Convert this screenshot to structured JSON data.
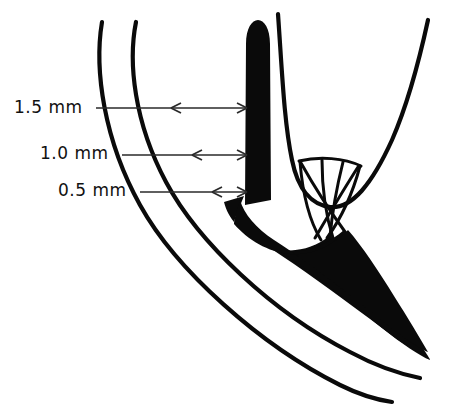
{
  "figure": {
    "width": 449,
    "height": 410,
    "background_color": "#ffffff",
    "ink_color": "#000000"
  },
  "measurements": [
    {
      "id": "m15",
      "label": "1.5 mm",
      "value": 1.5,
      "unit": "mm",
      "y": 108
    },
    {
      "id": "m10",
      "label": "1.0 mm",
      "value": 1.0,
      "unit": "mm",
      "y": 155
    },
    {
      "id": "m05",
      "label": "0.5 mm",
      "value": 0.5,
      "unit": "mm",
      "y": 192
    }
  ],
  "annotations": {
    "leader_line_count": 3,
    "arrow_style": "double-headed",
    "arrow_left_anchor": "outer-curve",
    "arrow_right_anchor": "black-column"
  },
  "structures": [
    {
      "name": "outer-curve",
      "description": "outermost thin curved line sweeping from upper-left to lower-right"
    },
    {
      "name": "inner-curve",
      "description": "second thin curved line parallel to the outer curve"
    },
    {
      "name": "black-column",
      "description": "solid black vertical column with rounded top"
    },
    {
      "name": "right-curve",
      "description": "thin curve descending from top then sweeping up to the right"
    },
    {
      "name": "fiber-mesh",
      "description": "criss-cross X-shaped fiber bundle between right curve and black mass"
    },
    {
      "name": "black-mass",
      "description": "solid black wedge tapering to the lower right"
    }
  ]
}
